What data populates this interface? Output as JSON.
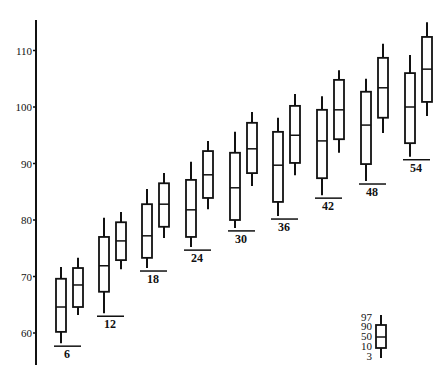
{
  "chart_data": {
    "type": "box",
    "title": "",
    "xlabel": "",
    "ylabel": "",
    "ylim": [
      55,
      117
    ],
    "yticks": [
      60,
      70,
      80,
      90,
      100,
      110
    ],
    "grid": false,
    "group_labels": [
      "6",
      "12",
      "18",
      "24",
      "30",
      "36",
      "42",
      "48",
      "54"
    ],
    "percentiles": [
      "3",
      "10",
      "50",
      "90",
      "97"
    ],
    "groups": [
      {
        "label": "6",
        "boxes": [
          {
            "p3": 58.2,
            "p10": 60.2,
            "p50": 64.6,
            "p90": 69.6,
            "p97": 71.7
          },
          {
            "p3": 63.2,
            "p10": 64.6,
            "p50": 68.5,
            "p90": 71.5,
            "p97": 73.3
          }
        ]
      },
      {
        "label": "12",
        "boxes": [
          {
            "p3": 63.5,
            "p10": 67.3,
            "p50": 71.9,
            "p90": 77.0,
            "p97": 80.4
          },
          {
            "p3": 71.3,
            "p10": 72.9,
            "p50": 76.3,
            "p90": 79.6,
            "p97": 81.4
          }
        ]
      },
      {
        "label": "18",
        "boxes": [
          {
            "p3": 71.5,
            "p10": 73.3,
            "p50": 77.2,
            "p90": 82.8,
            "p97": 85.5
          },
          {
            "p3": 76.8,
            "p10": 78.8,
            "p50": 82.8,
            "p90": 86.5,
            "p97": 88.3
          }
        ]
      },
      {
        "label": "24",
        "boxes": [
          {
            "p3": 75.2,
            "p10": 77.0,
            "p50": 81.8,
            "p90": 87.1,
            "p97": 90.3
          },
          {
            "p3": 81.9,
            "p10": 83.9,
            "p50": 88.0,
            "p90": 92.2,
            "p97": 94.0
          }
        ]
      },
      {
        "label": "30",
        "boxes": [
          {
            "p3": 78.6,
            "p10": 80.0,
            "p50": 85.7,
            "p90": 91.9,
            "p97": 95.6
          },
          {
            "p3": 86.0,
            "p10": 88.3,
            "p50": 92.6,
            "p90": 97.2,
            "p97": 99.1
          }
        ]
      },
      {
        "label": "36",
        "boxes": [
          {
            "p3": 80.7,
            "p10": 83.2,
            "p50": 89.7,
            "p90": 95.6,
            "p97": 98.1
          },
          {
            "p3": 87.9,
            "p10": 90.1,
            "p50": 95.0,
            "p90": 100.2,
            "p97": 102.3
          }
        ]
      },
      {
        "label": "42",
        "boxes": [
          {
            "p3": 84.4,
            "p10": 87.4,
            "p50": 94.0,
            "p90": 99.5,
            "p97": 101.9
          },
          {
            "p3": 91.9,
            "p10": 94.3,
            "p50": 99.5,
            "p90": 104.8,
            "p97": 106.5
          }
        ]
      },
      {
        "label": "48",
        "boxes": [
          {
            "p3": 86.9,
            "p10": 89.9,
            "p50": 96.8,
            "p90": 102.7,
            "p97": 105.0
          },
          {
            "p3": 95.4,
            "p10": 98.1,
            "p50": 103.4,
            "p90": 108.7,
            "p97": 111.2
          }
        ]
      },
      {
        "label": "54",
        "boxes": [
          {
            "p3": 91.2,
            "p10": 93.6,
            "p50": 100.0,
            "p90": 106.0,
            "p97": 109.2
          },
          {
            "p3": 98.4,
            "p10": 100.9,
            "p50": 106.7,
            "p90": 112.4,
            "p97": 115.0
          }
        ]
      }
    ],
    "legend": {
      "labels": [
        "97",
        "90",
        "50",
        "10",
        "3"
      ],
      "description": "Box legend: whiskers = 3rd and 97th percentile, box = 10th to 90th percentile, line = median (50th)"
    }
  },
  "axis": {
    "y_tick_labels": [
      "110",
      "100",
      "90",
      "80",
      "70",
      "60"
    ]
  },
  "legend": {
    "labels": [
      "97",
      "90",
      "50",
      "10",
      "3"
    ]
  },
  "ages": [
    "6",
    "12",
    "18",
    "24",
    "30",
    "36",
    "42",
    "48",
    "54"
  ]
}
